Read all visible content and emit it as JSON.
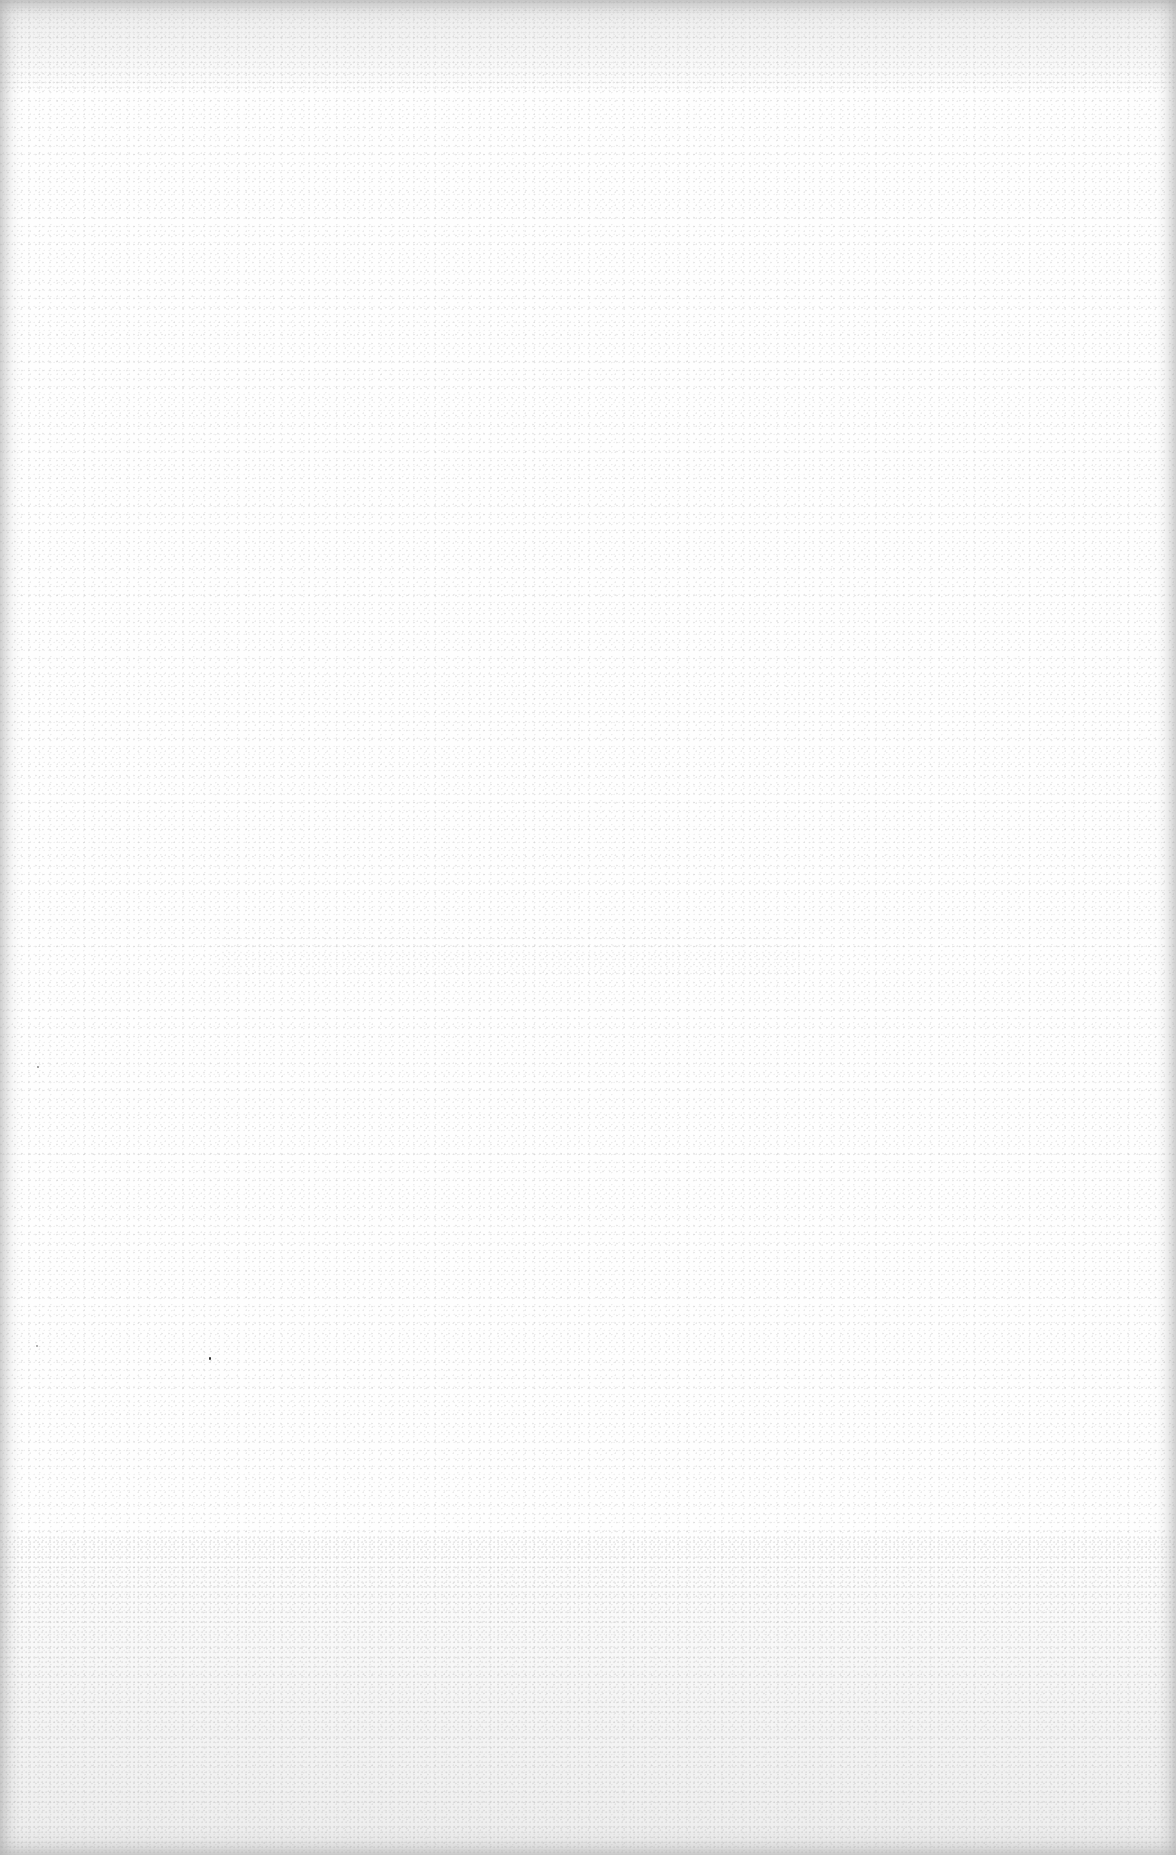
{
  "document": {
    "type": "scanned-page",
    "content": "",
    "background_color": "#fefefe",
    "edge_shadow_color": "#aaaaaa"
  }
}
